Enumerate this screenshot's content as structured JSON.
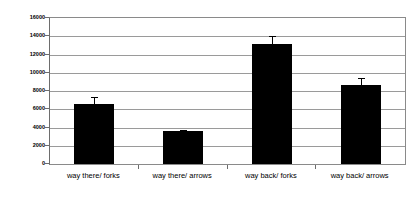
{
  "chart_data": {
    "type": "bar",
    "title": "",
    "subtitle": "",
    "xlabel": "",
    "ylabel": "RT in ms",
    "categories": [
      "way there/ forks",
      "way there/ arrows",
      "way back/ forks",
      "way back/ arrows"
    ],
    "values": [
      6550,
      3600,
      13200,
      8700
    ],
    "errors": [
      750,
      180,
      850,
      700
    ],
    "series": [
      {
        "name": "RT",
        "values": [
          6550,
          3600,
          13200,
          8700
        ],
        "errors": [
          750,
          180,
          850,
          700
        ]
      }
    ],
    "ylim": [
      0,
      16000
    ],
    "ytick_labels": [
      "0",
      "2000",
      "4000",
      "6000",
      "8000",
      "10000",
      "12000",
      "14000",
      "16000"
    ],
    "ytick_values": [
      0,
      2000,
      4000,
      6000,
      8000,
      10000,
      12000,
      14000,
      16000
    ],
    "grid": true,
    "grid_axis": "y",
    "legend": false,
    "legend_position": "none",
    "bar_color": "#000000",
    "grid_color": "#9a9a9a",
    "axis_color": "#6d6d6d",
    "background_color": "#ffffff",
    "error_bars": true,
    "annotations": []
  }
}
